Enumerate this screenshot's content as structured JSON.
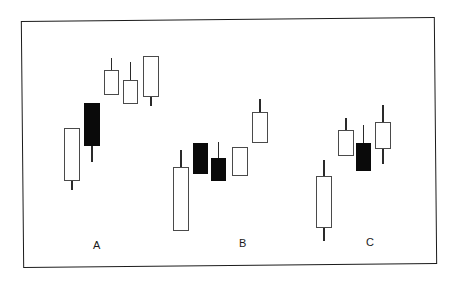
{
  "figure": {
    "title": "",
    "background_color": "#ffffff",
    "frame_color": "#1b1b1b",
    "width": 460,
    "height": 286
  },
  "chart_data": {
    "type": "candlestick",
    "title": "",
    "subtitle": "",
    "xlabel": "",
    "ylabel": "",
    "grid": false,
    "legend": null,
    "axes_visible": false,
    "tick_labels": [],
    "annotations": [
      {
        "text": "A",
        "x": 93,
        "y": 240
      },
      {
        "text": "B",
        "x": 239,
        "y": 238
      },
      {
        "text": "C",
        "x": 366,
        "y": 237
      }
    ],
    "colors": {
      "bullish_body": "#ffffff",
      "bullish_outline": "#4a4a4a",
      "bearish_body": "#0a0a0a",
      "wick": "#2a2a2a"
    },
    "note": "Pixel coordinates are top-down screen space: smaller y = higher price.",
    "groups": [
      {
        "label": "A",
        "label_x": 93,
        "label_y": 240,
        "candles": [
          {
            "name": "A1",
            "type": "bullish",
            "x": 64,
            "width": 16,
            "body_top": 128,
            "body_bottom": 181,
            "wick_top": 128,
            "wick_bottom": 190
          },
          {
            "name": "A2",
            "type": "bearish",
            "x": 84,
            "width": 16,
            "body_top": 103,
            "body_bottom": 146,
            "wick_top": 103,
            "wick_bottom": 162
          },
          {
            "name": "A3",
            "type": "bullish",
            "x": 104,
            "width": 15,
            "body_top": 70,
            "body_bottom": 95,
            "wick_top": 58,
            "wick_bottom": 95
          },
          {
            "name": "A4",
            "type": "bullish",
            "x": 123,
            "width": 15,
            "body_top": 80,
            "body_bottom": 104,
            "wick_top": 62,
            "wick_bottom": 104
          },
          {
            "name": "A5",
            "type": "bullish",
            "x": 143,
            "width": 16,
            "body_top": 56,
            "body_bottom": 97,
            "wick_top": 56,
            "wick_bottom": 106
          }
        ]
      },
      {
        "label": "B",
        "label_x": 239,
        "label_y": 238,
        "candles": [
          {
            "name": "B1",
            "type": "bullish",
            "x": 173,
            "width": 16,
            "body_top": 167,
            "body_bottom": 231,
            "wick_top": 150,
            "wick_bottom": 231
          },
          {
            "name": "B2",
            "type": "bearish",
            "x": 193,
            "width": 15,
            "body_top": 143,
            "body_bottom": 174,
            "wick_top": 143,
            "wick_bottom": 174
          },
          {
            "name": "B3",
            "type": "bearish",
            "x": 211,
            "width": 15,
            "body_top": 158,
            "body_bottom": 181,
            "wick_top": 142,
            "wick_bottom": 181
          },
          {
            "name": "B4",
            "type": "bullish",
            "x": 232,
            "width": 16,
            "body_top": 147,
            "body_bottom": 176,
            "wick_top": 147,
            "wick_bottom": 176
          },
          {
            "name": "B5",
            "type": "bullish",
            "x": 252,
            "width": 16,
            "body_top": 112,
            "body_bottom": 143,
            "wick_top": 99,
            "wick_bottom": 143
          }
        ]
      },
      {
        "label": "C",
        "label_x": 366,
        "label_y": 237,
        "candles": [
          {
            "name": "C1",
            "type": "bullish",
            "x": 316,
            "width": 16,
            "body_top": 176,
            "body_bottom": 228,
            "wick_top": 160,
            "wick_bottom": 241
          },
          {
            "name": "C2",
            "type": "bullish",
            "x": 338,
            "width": 16,
            "body_top": 130,
            "body_bottom": 156,
            "wick_top": 118,
            "wick_bottom": 156
          },
          {
            "name": "C3",
            "type": "bearish",
            "x": 356,
            "width": 15,
            "body_top": 143,
            "body_bottom": 171,
            "wick_top": 125,
            "wick_bottom": 171
          },
          {
            "name": "C4",
            "type": "bullish",
            "x": 375,
            "width": 16,
            "body_top": 122,
            "body_bottom": 149,
            "wick_top": 105,
            "wick_bottom": 164
          }
        ]
      }
    ]
  }
}
